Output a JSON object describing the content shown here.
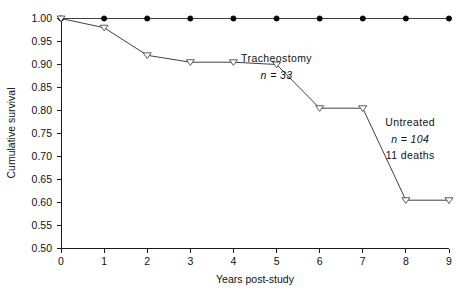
{
  "chart_data": {
    "type": "line",
    "title": "",
    "xlabel": "Years post-study",
    "ylabel": "Cumulative survival",
    "xlim": [
      0,
      9
    ],
    "ylim": [
      0.5,
      1.0
    ],
    "xticks": [
      "0",
      "1",
      "2",
      "3",
      "4",
      "5",
      "6",
      "7",
      "8",
      "9"
    ],
    "yticks": [
      "0.50",
      "0.55",
      "0.60",
      "0.65",
      "0.70",
      "0.75",
      "0.80",
      "0.85",
      "0.90",
      "0.95",
      "1.00"
    ],
    "grid": false,
    "legend_position": "inline-annotation",
    "x": [
      0,
      1,
      2,
      3,
      4,
      5,
      6,
      7,
      8,
      9
    ],
    "series": [
      {
        "name": "Tracheostomy",
        "marker": "filled-circle",
        "values": [
          1.0,
          1.0,
          1.0,
          1.0,
          1.0,
          1.0,
          1.0,
          1.0,
          1.0,
          1.0
        ]
      },
      {
        "name": "Untreated",
        "marker": "open-triangle-down",
        "values": [
          1.0,
          0.98,
          0.92,
          0.905,
          0.905,
          0.9,
          0.805,
          0.805,
          0.605,
          0.605
        ]
      }
    ],
    "annotations": [
      {
        "id": "tracheostomy-label",
        "text": "Tracheostomy",
        "x": 5.0,
        "y": 0.905,
        "italic": false
      },
      {
        "id": "tracheostomy-n",
        "text": "n  =  33",
        "x": 5.0,
        "y": 0.868,
        "italic": true
      },
      {
        "id": "untreated-label",
        "text": "Untreated",
        "x": 8.1,
        "y": 0.766,
        "italic": false
      },
      {
        "id": "untreated-n",
        "text": "n  =  104",
        "x": 8.1,
        "y": 0.73,
        "italic": true
      },
      {
        "id": "untreated-deaths",
        "text": "11  deaths",
        "x": 8.1,
        "y": 0.694,
        "italic": false
      }
    ],
    "colors": {
      "axis": "#1a1a1a",
      "tracheostomy_line": "#2a2a2a",
      "untreated_line": "#2a2a2a",
      "background": "#ffffff"
    }
  }
}
